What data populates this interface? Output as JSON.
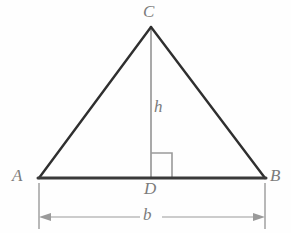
{
  "diagram": {
    "type": "geometry-figure",
    "background_color": "#fefefe",
    "labels": {
      "apex": "C",
      "left_vertex": "A",
      "right_vertex": "B",
      "foot_of_altitude": "D",
      "height": "h",
      "base": "b"
    },
    "colors": {
      "triangle_stroke": "#2f2f2f",
      "base_stroke": "#3a3a3a",
      "altitude_stroke": "#a9a9a9",
      "right_angle_stroke": "#9a9a9a",
      "dimension_stroke": "#9a9a9a",
      "label_text": "#7b7b7b"
    },
    "geometry": {
      "vertex_a": {
        "x": 39,
        "y": 178
      },
      "vertex_b": {
        "x": 265,
        "y": 178
      },
      "vertex_c": {
        "x": 151,
        "y": 27
      },
      "foot_d": {
        "x": 151,
        "y": 178
      },
      "right_angle_square": {
        "x": 151,
        "y": 153,
        "width": 21,
        "height": 25
      },
      "dimension_line_y": 217,
      "extension_line_top_y": 183,
      "extension_line_bottom_y": 229
    },
    "icons": {
      "right_angle": "right-angle-marker",
      "arrow_left": "arrow-left-icon",
      "arrow_right": "arrow-right-icon"
    }
  }
}
